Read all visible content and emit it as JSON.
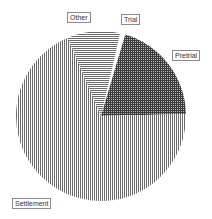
{
  "chart_data": {
    "type": "pie",
    "title": "",
    "start_angle_deg": 13,
    "direction": "clockwise",
    "slices": [
      {
        "label": "Trial",
        "value": 1,
        "pattern": "blank",
        "color": "#ffffff"
      },
      {
        "label": "Pretrial",
        "value": 20,
        "pattern": "crosshatch",
        "color": "#555555"
      },
      {
        "label": "Settlement",
        "value": 69,
        "pattern": "vertical-lines",
        "color": "#888888"
      },
      {
        "label": "Other",
        "value": 10,
        "pattern": "horizontal-lines",
        "color": "#999999"
      }
    ],
    "legend": "none",
    "labels_position": "outside-boxed"
  },
  "labels": {
    "other": "Other",
    "trial": "Trial",
    "pretrial": "Pretrial",
    "settlement": "Settlement"
  }
}
